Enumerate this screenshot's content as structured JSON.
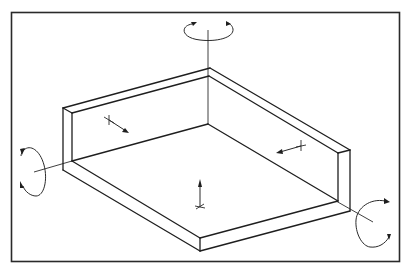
{
  "diagram": {
    "colors": {
      "background": "#ffffff",
      "line": "#1e1e1e",
      "frame": "#2a2a2a"
    },
    "frame": {
      "x": 11,
      "y": 12,
      "width": 389,
      "height": 250
    },
    "parts": [
      {
        "name": "floor-plate",
        "description": "base plate with thickness"
      },
      {
        "name": "back-left-wall",
        "description": "wall along left-back edge"
      },
      {
        "name": "back-right-wall",
        "description": "wall along right-back edge"
      }
    ],
    "rotations": [
      {
        "name": "rotation-vertical-axis",
        "axis": "vertical",
        "position": "top"
      },
      {
        "name": "rotation-left-axis",
        "axis": "horizontal-left",
        "position": "left"
      },
      {
        "name": "rotation-right-axis",
        "axis": "horizontal-right",
        "position": "bottom-right"
      }
    ],
    "translations": [
      {
        "name": "translation-left-wall",
        "direction": "normal to left wall"
      },
      {
        "name": "translation-right-wall",
        "direction": "normal to right wall"
      },
      {
        "name": "translation-floor",
        "direction": "normal to floor (up)"
      }
    ],
    "labels": []
  }
}
